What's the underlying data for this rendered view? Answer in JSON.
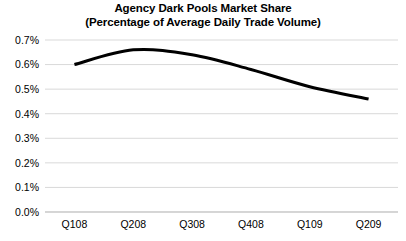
{
  "chart_data": {
    "type": "line",
    "title": "Agency Dark Pools Market Share",
    "subtitle": "(Percentage of Average Daily Trade Volume)",
    "xlabel": "",
    "ylabel": "",
    "categories": [
      "Q108",
      "Q208",
      "Q308",
      "Q408",
      "Q109",
      "Q209"
    ],
    "values": [
      0.6,
      0.66,
      0.64,
      0.58,
      0.51,
      0.46
    ],
    "series": [
      {
        "name": "Agency Dark Pools Market Share",
        "values": [
          0.6,
          0.66,
          0.64,
          0.58,
          0.51,
          0.46
        ]
      }
    ],
    "ylim": [
      0.0,
      0.7
    ],
    "ytick_values": [
      0.0,
      0.1,
      0.2,
      0.3,
      0.4,
      0.5,
      0.6,
      0.7
    ],
    "ytick_labels": [
      "0.0%",
      "0.1%",
      "0.2%",
      "0.3%",
      "0.4%",
      "0.5%",
      "0.6%",
      "0.7%"
    ],
    "value_format": "percent",
    "grid": {
      "horizontal": true,
      "vertical": false,
      "color": "#d9d9d9"
    },
    "legend": {
      "visible": false,
      "position": "none"
    },
    "smoothing": "spline",
    "line_color": "#000000",
    "line_width": 3,
    "markers": false,
    "background_color": "#ffffff"
  }
}
